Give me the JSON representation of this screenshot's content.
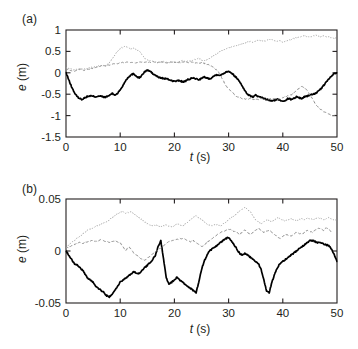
{
  "figure": {
    "panels": [
      {
        "id": "a",
        "label": "(a)",
        "xlabel_italic": "t",
        "xlabel_unit": " (s)",
        "ylabel_italic": "e",
        "ylabel_unit": " (m)"
      },
      {
        "id": "b",
        "label": "(b)",
        "xlabel_italic": "t",
        "xlabel_unit": " (s)",
        "ylabel_italic": "e",
        "ylabel_unit": " (m)"
      }
    ]
  },
  "chart_data": [
    {
      "type": "line",
      "panel": "(a)",
      "title": "",
      "xlabel": "t (s)",
      "ylabel": "e (m)",
      "xlim": [
        0,
        50
      ],
      "ylim": [
        -1.5,
        1
      ],
      "xticks": [
        0,
        10,
        20,
        30,
        40,
        50
      ],
      "yticks": [
        1,
        0.5,
        0,
        -0.5,
        -1,
        -1.5
      ],
      "xticklabels": [
        "0",
        "10",
        "20",
        "30",
        "40",
        "50"
      ],
      "yticklabels": [
        "1",
        "0.5",
        "0",
        "-0.5",
        "-1",
        "-1.5"
      ],
      "grid": false,
      "legend": null,
      "x": [
        0,
        0.5,
        1,
        1.5,
        2,
        2.5,
        3,
        3.5,
        4,
        4.5,
        5,
        5.5,
        6,
        6.5,
        7,
        7.5,
        8,
        8.5,
        9,
        9.5,
        10,
        10.5,
        11,
        11.5,
        12,
        12.5,
        13,
        13.5,
        14,
        14.5,
        15,
        15.5,
        16,
        16.5,
        17,
        17.5,
        18,
        18.5,
        19,
        19.5,
        20,
        20.5,
        21,
        21.5,
        22,
        22.5,
        23,
        23.5,
        24,
        24.5,
        25,
        25.5,
        26,
        26.5,
        27,
        27.5,
        28,
        28.5,
        29,
        29.5,
        30,
        30.5,
        31,
        31.5,
        32,
        32.5,
        33,
        33.5,
        34,
        34.5,
        35,
        35.5,
        36,
        36.5,
        37,
        37.5,
        38,
        38.5,
        39,
        39.5,
        40,
        40.5,
        41,
        41.5,
        42,
        42.5,
        43,
        43.5,
        44,
        44.5,
        45,
        45.5,
        46,
        46.5,
        47,
        47.5,
        48,
        48.5,
        49,
        49.5,
        50
      ],
      "series": [
        {
          "name": "solid-black",
          "style": "solid",
          "color": "#000000",
          "values": [
            0.0,
            -0.16,
            -0.32,
            -0.45,
            -0.55,
            -0.6,
            -0.62,
            -0.58,
            -0.55,
            -0.54,
            -0.55,
            -0.56,
            -0.54,
            -0.55,
            -0.57,
            -0.56,
            -0.53,
            -0.48,
            -0.52,
            -0.48,
            -0.4,
            -0.3,
            -0.18,
            -0.1,
            -0.05,
            -0.02,
            -0.08,
            -0.12,
            -0.06,
            0.02,
            0.06,
            0.04,
            -0.02,
            -0.06,
            -0.1,
            -0.12,
            -0.13,
            -0.14,
            -0.16,
            -0.18,
            -0.2,
            -0.19,
            -0.18,
            -0.21,
            -0.2,
            -0.16,
            -0.14,
            -0.12,
            -0.14,
            -0.16,
            -0.13,
            -0.1,
            -0.12,
            -0.14,
            -0.1,
            -0.06,
            -0.04,
            -0.06,
            -0.02,
            0.02,
            0.04,
            0.0,
            -0.06,
            -0.12,
            -0.2,
            -0.3,
            -0.42,
            -0.5,
            -0.54,
            -0.56,
            -0.52,
            -0.56,
            -0.58,
            -0.6,
            -0.62,
            -0.64,
            -0.66,
            -0.64,
            -0.62,
            -0.64,
            -0.66,
            -0.64,
            -0.6,
            -0.62,
            -0.6,
            -0.56,
            -0.58,
            -0.6,
            -0.56,
            -0.54,
            -0.52,
            -0.5,
            -0.48,
            -0.44,
            -0.38,
            -0.3,
            -0.22,
            -0.14,
            -0.08,
            -0.02,
            0.0
          ]
        },
        {
          "name": "dashed-gray",
          "style": "dashed",
          "color": "#8d8d8d",
          "values": [
            0.1,
            0.07,
            0.05,
            0.04,
            0.06,
            0.08,
            0.07,
            0.06,
            0.08,
            0.1,
            0.11,
            0.13,
            0.14,
            0.16,
            0.17,
            0.16,
            0.18,
            0.2,
            0.21,
            0.22,
            0.23,
            0.24,
            0.24,
            0.25,
            0.24,
            0.23,
            0.24,
            0.25,
            0.26,
            0.25,
            0.24,
            0.25,
            0.26,
            0.25,
            0.24,
            0.25,
            0.24,
            0.23,
            0.24,
            0.25,
            0.24,
            0.23,
            0.24,
            0.26,
            0.25,
            0.24,
            0.25,
            0.24,
            0.23,
            0.22,
            0.24,
            0.22,
            0.2,
            0.18,
            0.15,
            0.1,
            0.04,
            -0.05,
            -0.18,
            -0.3,
            -0.38,
            -0.44,
            -0.5,
            -0.55,
            -0.58,
            -0.6,
            -0.62,
            -0.61,
            -0.6,
            -0.62,
            -0.63,
            -0.62,
            -0.6,
            -0.62,
            -0.64,
            -0.62,
            -0.6,
            -0.61,
            -0.62,
            -0.6,
            -0.58,
            -0.56,
            -0.54,
            -0.52,
            -0.48,
            -0.42,
            -0.36,
            -0.32,
            -0.35,
            -0.42,
            -0.52,
            -0.62,
            -0.72,
            -0.8,
            -0.86,
            -0.9,
            -0.94,
            -0.96,
            -0.99,
            -1.0,
            -0.98,
            -1.04
          ]
        },
        {
          "name": "dotted-gray",
          "style": "dotted",
          "color": "#a0a0a0",
          "values": [
            0.12,
            0.1,
            0.08,
            0.07,
            0.08,
            0.09,
            0.08,
            0.09,
            0.1,
            0.12,
            0.13,
            0.14,
            0.16,
            0.17,
            0.16,
            0.18,
            0.24,
            0.32,
            0.42,
            0.5,
            0.56,
            0.6,
            0.62,
            0.6,
            0.55,
            0.58,
            0.54,
            0.52,
            0.42,
            0.34,
            0.3,
            0.28,
            0.26,
            0.25,
            0.24,
            0.25,
            0.26,
            0.25,
            0.24,
            0.25,
            0.26,
            0.25,
            0.27,
            0.28,
            0.26,
            0.27,
            0.28,
            0.3,
            0.32,
            0.34,
            0.3,
            0.28,
            0.3,
            0.34,
            0.38,
            0.42,
            0.46,
            0.5,
            0.54,
            0.56,
            0.58,
            0.6,
            0.62,
            0.64,
            0.66,
            0.68,
            0.7,
            0.72,
            0.74,
            0.72,
            0.74,
            0.76,
            0.75,
            0.74,
            0.76,
            0.78,
            0.77,
            0.76,
            0.74,
            0.76,
            0.72,
            0.74,
            0.76,
            0.78,
            0.8,
            0.82,
            0.84,
            0.85,
            0.86,
            0.85,
            0.84,
            0.86,
            0.88,
            0.86,
            0.84,
            0.86,
            0.85,
            0.84,
            0.82,
            0.8,
            0.82
          ]
        }
      ]
    },
    {
      "type": "line",
      "panel": "(b)",
      "title": "",
      "xlabel": "t (s)",
      "ylabel": "e (m)",
      "xlim": [
        0,
        50
      ],
      "ylim": [
        -0.05,
        0.05
      ],
      "xticks": [
        0,
        10,
        20,
        30,
        40,
        50
      ],
      "yticks": [
        0.05,
        0,
        -0.05
      ],
      "xticklabels": [
        "0",
        "10",
        "20",
        "30",
        "40",
        "50"
      ],
      "yticklabels": [
        "0.05",
        "0",
        "-0.05"
      ],
      "grid": false,
      "legend": null,
      "x": [
        0,
        0.5,
        1,
        1.5,
        2,
        2.5,
        3,
        3.5,
        4,
        4.5,
        5,
        5.5,
        6,
        6.5,
        7,
        7.5,
        8,
        8.5,
        9,
        9.5,
        10,
        10.5,
        11,
        11.5,
        12,
        12.5,
        13,
        13.5,
        14,
        14.5,
        15,
        15.5,
        16,
        16.5,
        17,
        17.5,
        18,
        18.5,
        19,
        19.5,
        20,
        20.5,
        21,
        21.5,
        22,
        22.5,
        23,
        23.5,
        24,
        24.5,
        25,
        25.5,
        26,
        26.5,
        27,
        27.5,
        28,
        28.5,
        29,
        29.5,
        30,
        30.5,
        31,
        31.5,
        32,
        32.5,
        33,
        33.5,
        34,
        34.5,
        35,
        35.5,
        36,
        36.5,
        37,
        37.5,
        38,
        38.5,
        39,
        39.5,
        40,
        40.5,
        41,
        41.5,
        42,
        42.5,
        43,
        43.5,
        44,
        44.5,
        45,
        45.5,
        46,
        46.5,
        47,
        47.5,
        48,
        48.5,
        49,
        49.5,
        50
      ],
      "series": [
        {
          "name": "solid-black",
          "style": "solid",
          "color": "#000000",
          "values": [
            0.0,
            -0.004,
            -0.008,
            -0.012,
            -0.013,
            -0.016,
            -0.018,
            -0.022,
            -0.026,
            -0.028,
            -0.03,
            -0.034,
            -0.036,
            -0.038,
            -0.04,
            -0.043,
            -0.044,
            -0.042,
            -0.038,
            -0.034,
            -0.03,
            -0.028,
            -0.026,
            -0.024,
            -0.022,
            -0.02,
            -0.021,
            -0.022,
            -0.019,
            -0.016,
            -0.014,
            -0.011,
            -0.008,
            -0.004,
            0.004,
            0.01,
            -0.008,
            -0.026,
            -0.032,
            -0.03,
            -0.028,
            -0.025,
            -0.028,
            -0.03,
            -0.032,
            -0.034,
            -0.036,
            -0.038,
            -0.04,
            -0.03,
            -0.018,
            -0.01,
            -0.004,
            0.0,
            0.002,
            0.004,
            0.006,
            0.008,
            0.01,
            0.012,
            0.013,
            0.01,
            0.006,
            0.002,
            -0.002,
            -0.004,
            -0.002,
            -0.004,
            -0.006,
            -0.008,
            -0.01,
            -0.012,
            -0.018,
            -0.028,
            -0.038,
            -0.04,
            -0.03,
            -0.022,
            -0.016,
            -0.012,
            -0.01,
            -0.008,
            -0.006,
            -0.004,
            -0.002,
            0.0,
            0.002,
            0.004,
            0.006,
            0.008,
            0.01,
            0.01,
            0.009,
            0.008,
            0.008,
            0.007,
            0.006,
            0.005,
            0.002,
            -0.004,
            -0.01
          ]
        },
        {
          "name": "dashed-gray",
          "style": "dashed",
          "color": "#8d8d8d",
          "values": [
            0.002,
            0.004,
            0.005,
            0.006,
            0.007,
            0.008,
            0.007,
            0.008,
            0.009,
            0.01,
            0.01,
            0.009,
            0.01,
            0.011,
            0.01,
            0.009,
            0.008,
            0.009,
            0.01,
            0.009,
            0.008,
            0.004,
            0.0,
            0.004,
            0.002,
            -0.002,
            -0.004,
            -0.006,
            -0.008,
            -0.009,
            -0.007,
            -0.005,
            -0.003,
            -0.001,
            0.001,
            0.003,
            0.005,
            0.007,
            0.009,
            0.01,
            0.011,
            0.011,
            0.012,
            0.012,
            0.011,
            0.01,
            0.009,
            0.01,
            0.008,
            0.006,
            0.004,
            0.006,
            0.008,
            0.01,
            0.012,
            0.014,
            0.016,
            0.018,
            0.019,
            0.02,
            0.021,
            0.02,
            0.019,
            0.018,
            0.016,
            0.018,
            0.02,
            0.018,
            0.016,
            0.018,
            0.02,
            0.022,
            0.02,
            0.018,
            0.019,
            0.02,
            0.018,
            0.016,
            0.014,
            0.012,
            0.014,
            0.016,
            0.015,
            0.014,
            0.016,
            0.018,
            0.017,
            0.016,
            0.018,
            0.02,
            0.019,
            0.018,
            0.02,
            0.022,
            0.021,
            0.02,
            0.022,
            0.021,
            0.018
          ]
        },
        {
          "name": "dotted-gray",
          "style": "dotted",
          "color": "#a0a0a0",
          "values": [
            0.003,
            0.006,
            0.008,
            0.01,
            0.012,
            0.014,
            0.016,
            0.018,
            0.02,
            0.021,
            0.022,
            0.024,
            0.025,
            0.026,
            0.027,
            0.028,
            0.03,
            0.032,
            0.034,
            0.036,
            0.037,
            0.038,
            0.036,
            0.037,
            0.038,
            0.036,
            0.034,
            0.032,
            0.03,
            0.028,
            0.026,
            0.025,
            0.024,
            0.025,
            0.024,
            0.023,
            0.024,
            0.025,
            0.024,
            0.023,
            0.024,
            0.026,
            0.025,
            0.024,
            0.026,
            0.028,
            0.03,
            0.032,
            0.034,
            0.032,
            0.03,
            0.028,
            0.026,
            0.025,
            0.024,
            0.026,
            0.025,
            0.024,
            0.026,
            0.028,
            0.03,
            0.032,
            0.034,
            0.036,
            0.038,
            0.04,
            0.042,
            0.04,
            0.038,
            0.034,
            0.03,
            0.028,
            0.026,
            0.028,
            0.03,
            0.029,
            0.028,
            0.03,
            0.032,
            0.031,
            0.03,
            0.029,
            0.03,
            0.031,
            0.03,
            0.029,
            0.03,
            0.031,
            0.03,
            0.032,
            0.031,
            0.03,
            0.031,
            0.032,
            0.031,
            0.03,
            0.031,
            0.032,
            0.031,
            0.03,
            0.03
          ]
        }
      ]
    }
  ]
}
